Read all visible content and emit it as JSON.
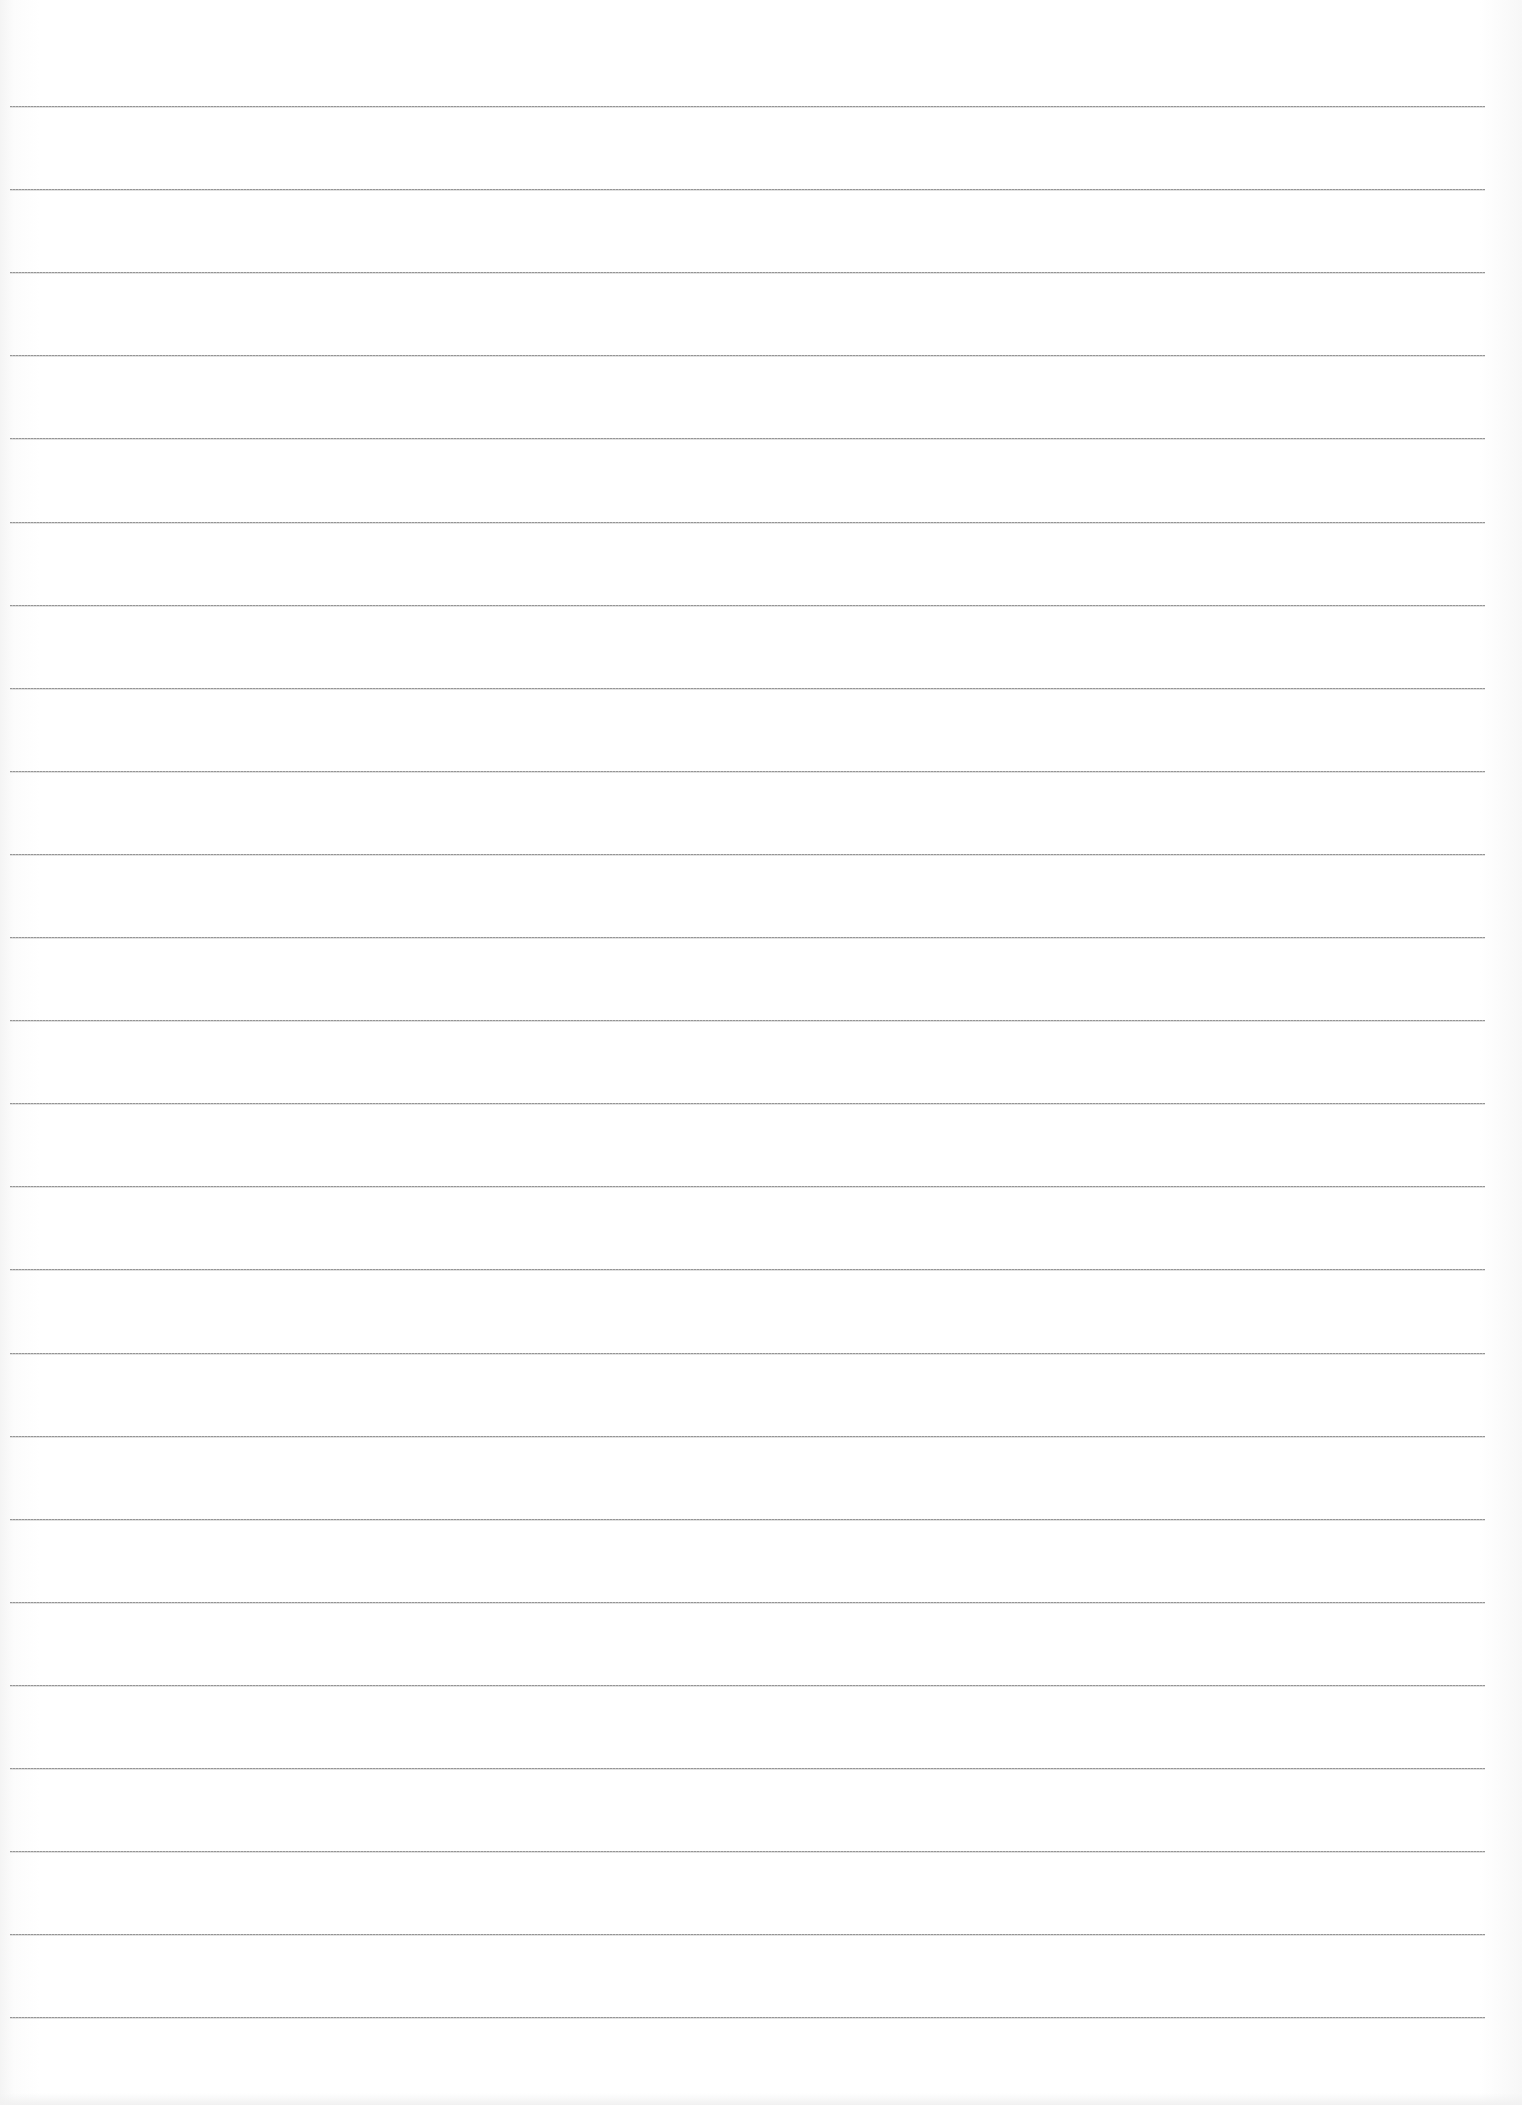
{
  "document": {
    "type": "blank lined paper (scanned)",
    "background_color": "#fdfdfd",
    "line_color": "#8a8a8a",
    "line_count": 24,
    "lines_left_px": 10,
    "lines_right_px": 1485,
    "first_line_y": 106,
    "line_spacing_px": 83.1,
    "text_content": ""
  }
}
